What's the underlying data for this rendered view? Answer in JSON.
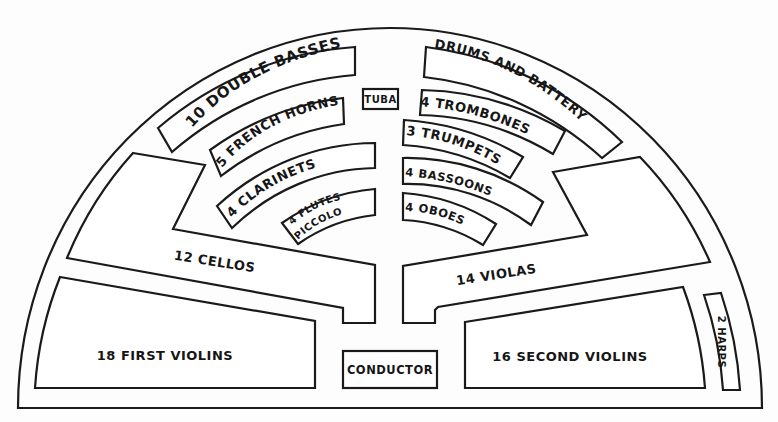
{
  "colors": {
    "ink": "#1a1a1a",
    "paper": "#ffffff"
  },
  "sections": {
    "double_basses": {
      "label": "10 DOUBLE BASSES",
      "count": 10,
      "instrument": "Double Basses"
    },
    "tuba": {
      "label": "TUBA",
      "count": 1,
      "instrument": "Tuba"
    },
    "drums": {
      "label": "DRUMS AND BATTERY",
      "instrument": "Drums and Battery"
    },
    "french_horns": {
      "label": "5 FRENCH HORNS",
      "count": 5,
      "instrument": "French Horns"
    },
    "trombones": {
      "label": "4 TROMBONES",
      "count": 4,
      "instrument": "Trombones"
    },
    "trumpets": {
      "label": "3 TRUMPETS",
      "count": 3,
      "instrument": "Trumpets"
    },
    "clarinets": {
      "label": "4 CLARINETS",
      "count": 4,
      "instrument": "Clarinets"
    },
    "bassoons": {
      "label": "4 BASSOONS",
      "count": 4,
      "instrument": "Bassoons"
    },
    "flutes": {
      "label_line1": "4 FLUTES",
      "label_line2": "PICCOLO",
      "count": 4,
      "instrument": "Flutes, Piccolo"
    },
    "oboes": {
      "label": "4 OBOES",
      "count": 4,
      "instrument": "Oboes"
    },
    "cellos": {
      "label": "12 CELLOS",
      "count": 12,
      "instrument": "Cellos"
    },
    "violas": {
      "label": "14 VIOLAS",
      "count": 14,
      "instrument": "Violas"
    },
    "first_violins": {
      "label": "18 FIRST  VIOLINS",
      "count": 18,
      "instrument": "First Violins"
    },
    "second_violins": {
      "label": "16 SECOND VIOLINS",
      "count": 16,
      "instrument": "Second Violins"
    },
    "harps": {
      "label": "2 HARPS",
      "count": 2,
      "instrument": "Harps"
    },
    "conductor": {
      "label": "CONDUCTOR"
    }
  }
}
